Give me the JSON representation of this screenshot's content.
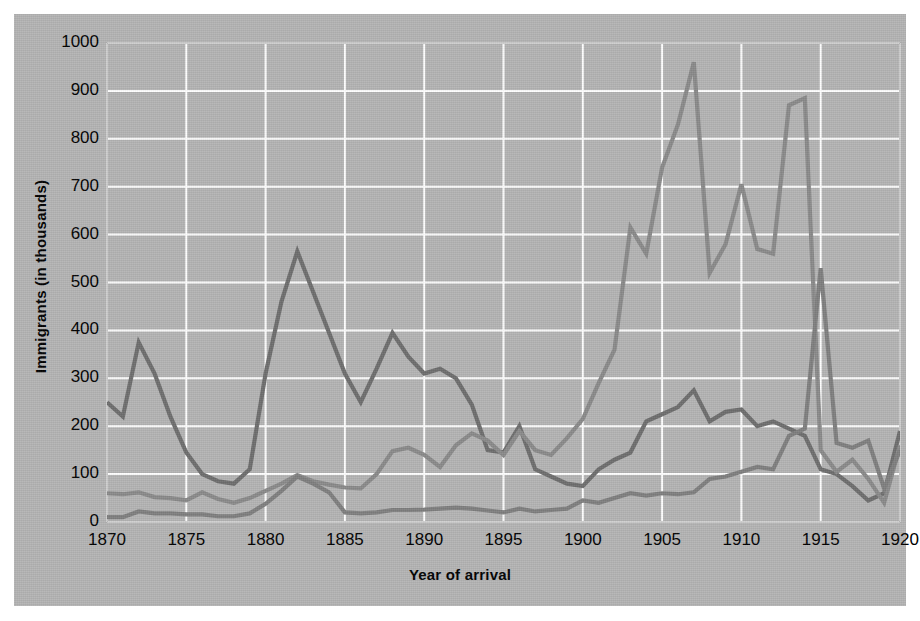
{
  "figure": {
    "background_color": "#b4b4b4",
    "page_color": "#ffffff",
    "plot_area_color": "#b4b4b4",
    "grid_color": "#ffffff"
  },
  "axes": {
    "y_title": "Immigrants (in thousands)",
    "x_title": "Year of arrival",
    "y_ticks": [
      "0",
      "100",
      "200",
      "300",
      "400",
      "500",
      "600",
      "700",
      "800",
      "900",
      "1000"
    ],
    "x_ticks": [
      "1870",
      "1875",
      "1880",
      "1885",
      "1890",
      "1895",
      "1900",
      "1905",
      "1910",
      "1915",
      "1920"
    ]
  },
  "chart_data": {
    "type": "line",
    "title": "",
    "xlabel": "Year of arrival",
    "ylabel": "Immigrants (in thousands)",
    "xlim": [
      1870,
      1920
    ],
    "ylim": [
      0,
      1000
    ],
    "grid": true,
    "legend": "none",
    "x": [
      1870,
      1871,
      1872,
      1873,
      1874,
      1875,
      1876,
      1877,
      1878,
      1879,
      1880,
      1881,
      1882,
      1883,
      1884,
      1885,
      1886,
      1887,
      1888,
      1889,
      1890,
      1891,
      1892,
      1893,
      1894,
      1895,
      1896,
      1897,
      1898,
      1899,
      1900,
      1901,
      1902,
      1903,
      1904,
      1905,
      1906,
      1907,
      1908,
      1909,
      1910,
      1911,
      1912,
      1913,
      1914,
      1915,
      1916,
      1917,
      1918,
      1919,
      1920
    ],
    "series": [
      {
        "name": "series-dark",
        "color": "#6e6e6e",
        "values": [
          250,
          220,
          375,
          310,
          220,
          145,
          100,
          85,
          80,
          110,
          310,
          460,
          565,
          480,
          395,
          310,
          250,
          320,
          395,
          345,
          310,
          320,
          300,
          245,
          150,
          145,
          200,
          110,
          95,
          80,
          75,
          110,
          130,
          145,
          210,
          225,
          240,
          275,
          210,
          230,
          235,
          200,
          210,
          195,
          180,
          110,
          100,
          75,
          45,
          60,
          190
        ]
      },
      {
        "name": "series-mid",
        "color": "#8a8a8a",
        "values": [
          60,
          58,
          62,
          52,
          50,
          45,
          62,
          48,
          40,
          50,
          65,
          80,
          98,
          85,
          78,
          72,
          70,
          100,
          148,
          155,
          140,
          115,
          160,
          185,
          170,
          140,
          190,
          150,
          140,
          175,
          215,
          290,
          360,
          615,
          560,
          740,
          830,
          960,
          520,
          580,
          705,
          570,
          560,
          870,
          885,
          150,
          105,
          130,
          90,
          40,
          160
        ]
      },
      {
        "name": "series-light",
        "color": "#7f7f7f",
        "values": [
          10,
          10,
          22,
          18,
          18,
          16,
          16,
          12,
          12,
          18,
          38,
          65,
          95,
          80,
          62,
          20,
          18,
          20,
          25,
          25,
          26,
          28,
          30,
          28,
          24,
          20,
          28,
          22,
          25,
          28,
          45,
          40,
          50,
          60,
          55,
          60,
          58,
          62,
          90,
          95,
          105,
          115,
          110,
          180,
          195,
          530,
          165,
          155,
          170,
          70,
          150
        ]
      }
    ]
  }
}
